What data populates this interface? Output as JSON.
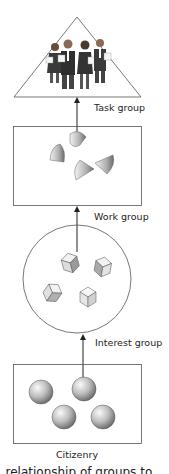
{
  "diagram": {
    "levels": [
      {
        "id": "task",
        "label": "Task group",
        "shape": "triangle",
        "members": "people-icon x4"
      },
      {
        "id": "work",
        "label": "Work group",
        "shape": "rectangle",
        "members": "cone-icon x4"
      },
      {
        "id": "interest",
        "label": "Interest group",
        "shape": "circle",
        "members": "cube-icon x4"
      },
      {
        "id": "citizenry",
        "label": "Citizenry",
        "shape": "rectangle",
        "members": "sphere-icon x4"
      }
    ],
    "arrows": [
      {
        "from": "citizenry",
        "to": "interest"
      },
      {
        "from": "interest",
        "to": "work"
      },
      {
        "from": "work",
        "to": "task"
      }
    ],
    "caption": "relationship of groups to..."
  },
  "colors": {
    "stroke": "#333333",
    "shape_fill": "#b5b5b5",
    "highlight": "#f2f2f2"
  }
}
